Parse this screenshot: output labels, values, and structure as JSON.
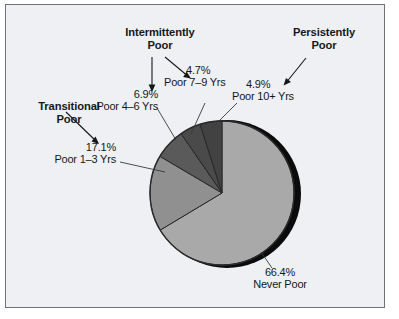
{
  "figure": {
    "background_color": "#eef0f3",
    "border_color": "#6d7377",
    "text_color": "#15181b"
  },
  "chart_data": {
    "type": "pie",
    "title": "",
    "subtitle": "",
    "xlabel": "",
    "ylabel": "",
    "legend_position": "none",
    "grid": false,
    "units": "percent",
    "start_angle_deg": 0,
    "direction": "clockwise",
    "categories": [
      "Never Poor",
      "Poor 1–3 Yrs",
      "Poor 4–6 Yrs",
      "Poor 7–9 Yrs",
      "Poor 10+ Yrs"
    ],
    "values": [
      66.4,
      17.1,
      6.9,
      4.7,
      4.9
    ],
    "value_labels": [
      "66.4%",
      "17.1%",
      "6.9%",
      "4.7%",
      "4.9%"
    ],
    "slice_colors": [
      "#a9a9a9",
      "#909090",
      "#5a5a5a",
      "#4a4a4a",
      "#424242"
    ],
    "slices": [
      {
        "name": "Never Poor",
        "value": 66.4,
        "pct_label": "66.4%",
        "color": "#a9a9a9"
      },
      {
        "name": "Poor 1–3 Yrs",
        "value": 17.1,
        "pct_label": "17.1%",
        "color": "#909090"
      },
      {
        "name": "Poor 4–6 Yrs",
        "value": 6.9,
        "pct_label": "6.9%",
        "color": "#5a5a5a"
      },
      {
        "name": "Poor 7–9 Yrs",
        "value": 4.7,
        "pct_label": "4.7%",
        "color": "#4a4a4a"
      },
      {
        "name": "Poor 10+ Yrs",
        "value": 4.9,
        "pct_label": "4.9%",
        "color": "#424242"
      }
    ],
    "groups": [
      {
        "label_line1": "Transitional",
        "label_line2": "Poor",
        "points_to": [
          "Poor 1–3 Yrs"
        ]
      },
      {
        "label_line1": "Intermittently",
        "label_line2": "Poor",
        "points_to": [
          "Poor 4–6 Yrs",
          "Poor 7–9 Yrs"
        ]
      },
      {
        "label_line1": "Persistently",
        "label_line2": "Poor",
        "points_to": [
          "Poor 10+ Yrs"
        ]
      }
    ]
  },
  "annotations": {
    "transitional": {
      "line1": "Transitional",
      "line2": "Poor"
    },
    "intermittently": {
      "line1": "Intermittently",
      "line2": "Poor"
    },
    "persistently": {
      "line1": "Persistently",
      "line2": "Poor"
    }
  },
  "callouts": {
    "poor_1_3": {
      "pct": "17.1%",
      "name": "Poor 1–3 Yrs"
    },
    "poor_4_6": {
      "pct": "6.9%",
      "name": "Poor 4–6 Yrs"
    },
    "poor_7_9": {
      "pct": "4.7%",
      "name": "Poor 7–9 Yrs"
    },
    "poor_10_plus": {
      "pct": "4.9%",
      "name": "Poor 10+ Yrs"
    },
    "never_poor": {
      "pct": "66.4%",
      "name": "Never Poor"
    }
  }
}
